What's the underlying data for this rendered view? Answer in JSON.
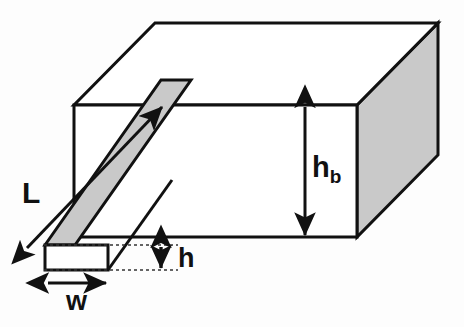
{
  "figure": {
    "background_color": "#fdfdfd",
    "stroke_color": "#111111",
    "shaded_face_color": "#c9c9c9",
    "fin_face_color": "#c9c9c9",
    "unshaded_face_color": "#ffffff",
    "dotted_guide_color": "#444444",
    "labels": {
      "length": "L",
      "width": "w",
      "fin_height": "h",
      "base_height": "h",
      "base_height_subscript": "b"
    },
    "dimension_lines": [
      {
        "name": "length-L",
        "label": "L",
        "style": "double-headed-diagonal-arrow"
      },
      {
        "name": "width-w",
        "label": "w",
        "style": "double-headed-horizontal-arrow"
      },
      {
        "name": "fin-height-h",
        "label": "h",
        "style": "double-headed-vertical-arrow"
      },
      {
        "name": "base-height-hb",
        "label": "hb",
        "style": "double-headed-vertical-arrow"
      }
    ],
    "geometry": {
      "block_top_face": "155,23 438,23 357,105 74,105",
      "block_front_face": "74,105 357,105 357,237 74,237",
      "block_right_face": "357,105 438,23 438,155 357,237",
      "fin_side_face": "39,270 155,105 185,105 69,270",
      "fin_end_face": "45,245 108,245 108,270 45,270",
      "fin_top_edge": "45,245 161,80"
    }
  }
}
